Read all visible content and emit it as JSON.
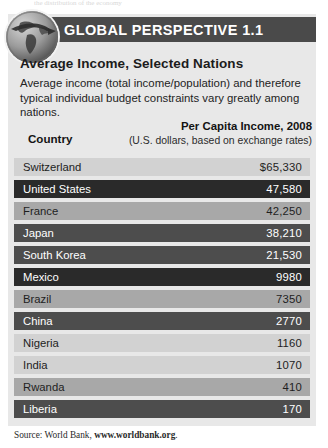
{
  "page": {
    "top_clipped_text": "the distribution of the economy"
  },
  "banner": {
    "title": "GLOBAL PERSPECTIVE 1.1",
    "icon": "globe-icon",
    "bar_color": "#4a4a4a"
  },
  "section": {
    "title": "Average Income, Selected Nations",
    "body": "Average income (total income/population) and therefore typical individual budget constraints vary greatly among nations."
  },
  "table": {
    "headers": {
      "country": "Country",
      "income_line1": "Per Capita Income, 2008",
      "income_line2": "(U.S. dollars, based on exchange rates)"
    },
    "rows": [
      {
        "country": "Switzerland",
        "income": "$65,330",
        "tone": "tone-light"
      },
      {
        "country": "United States",
        "income": "47,580",
        "tone": "tone-dark"
      },
      {
        "country": "France",
        "income": "42,250",
        "tone": "tone-mid"
      },
      {
        "country": "Japan",
        "income": "38,210",
        "tone": "tone-dark2"
      },
      {
        "country": "South Korea",
        "income": "21,530",
        "tone": "tone-dark2"
      },
      {
        "country": "Mexico",
        "income": "9980",
        "tone": "tone-dark"
      },
      {
        "country": "Brazil",
        "income": "7350",
        "tone": "tone-mid"
      },
      {
        "country": "China",
        "income": "2770",
        "tone": "tone-dark2"
      },
      {
        "country": "Nigeria",
        "income": "1160",
        "tone": "tone-light"
      },
      {
        "country": "India",
        "income": "1070",
        "tone": "tone-light"
      },
      {
        "country": "Rwanda",
        "income": "410",
        "tone": "tone-mid"
      },
      {
        "country": "Liberia",
        "income": "170",
        "tone": "tone-dark2"
      }
    ]
  },
  "source": {
    "prefix": "Source: World Bank, ",
    "url": "www.worldbank.org",
    "suffix": "."
  },
  "chart_data": {
    "type": "table",
    "title": "Average Income, Selected Nations",
    "xlabel": "Country",
    "ylabel": "Per Capita Income, 2008 (U.S. dollars, based on exchange rates)",
    "categories": [
      "Switzerland",
      "United States",
      "France",
      "Japan",
      "South Korea",
      "Mexico",
      "Brazil",
      "China",
      "Nigeria",
      "India",
      "Rwanda",
      "Liberia"
    ],
    "values": [
      65330,
      47580,
      42250,
      38210,
      21530,
      9980,
      7350,
      2770,
      1160,
      1070,
      410,
      170
    ],
    "units": "USD",
    "year": 2008,
    "source": "World Bank, www.worldbank.org"
  }
}
